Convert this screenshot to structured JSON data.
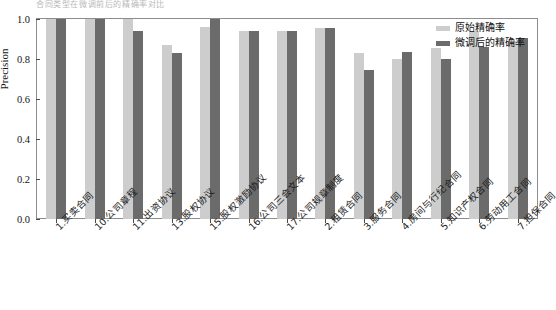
{
  "top_crop_text": "合同类型在微调前后的精确率对比",
  "chart_data": {
    "type": "bar",
    "title": "",
    "xlabel": "",
    "ylabel": "Precision",
    "ylim": [
      0.0,
      1.0
    ],
    "yticks": [
      "0.0",
      "0.2",
      "0.4",
      "0.6",
      "0.8",
      "1.0"
    ],
    "ytick_values": [
      0.0,
      0.2,
      0.4,
      0.6,
      0.8,
      1.0
    ],
    "grid": false,
    "legend_position": "top-right",
    "categories": [
      "1.买卖合同",
      "10.公司章程",
      "11.出资协议",
      "13.股权协议",
      "15.股权激励协议",
      "16.公司三会文本",
      "17.公司规章制度",
      "2.租赁合同",
      "3.服务合同",
      "4.房间与行纪合同",
      "5.知识产权合同",
      "6.劳动用工合同",
      "7.担保合同"
    ],
    "series": [
      {
        "name": "原始精确率",
        "color": "#cdcdcd",
        "values": [
          1.0,
          1.0,
          1.0,
          0.87,
          0.96,
          0.94,
          0.94,
          0.955,
          0.83,
          0.8,
          0.855,
          0.94,
          0.89
        ]
      },
      {
        "name": "微调后的精确率",
        "color": "#6b6b6b",
        "values": [
          1.0,
          1.0,
          0.94,
          0.83,
          1.0,
          0.94,
          0.94,
          0.955,
          0.745,
          0.835,
          0.8,
          0.86,
          0.905
        ]
      }
    ]
  },
  "legend": {
    "items": [
      {
        "label": "原始精确率",
        "color": "#cdcdcd"
      },
      {
        "label": "微调后的精确率",
        "color": "#6b6b6b"
      }
    ]
  }
}
